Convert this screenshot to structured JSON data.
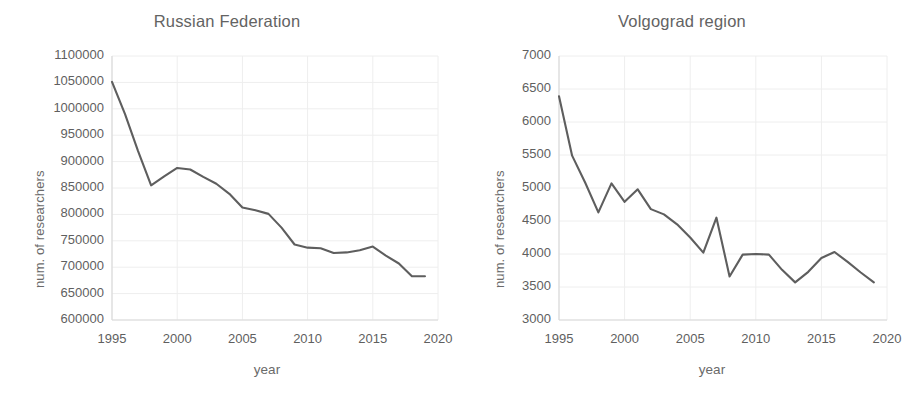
{
  "figure": {
    "background": "#ffffff",
    "line_color": "#5e5e5e",
    "grid_color": "#eeeeee",
    "axis_color": "#d9d9d9",
    "text_color": "#5f5f5f"
  },
  "chart_data": [
    {
      "type": "line",
      "title": "Russian Federation",
      "xlabel": "year",
      "ylabel": "num. of researchers",
      "xlim": [
        1995,
        2020
      ],
      "ylim": [
        600000,
        1100000
      ],
      "xticks": [
        1995,
        2000,
        2005,
        2010,
        2015,
        2020
      ],
      "yticks": [
        600000,
        650000,
        700000,
        750000,
        800000,
        850000,
        900000,
        950000,
        1000000,
        1050000,
        1100000
      ],
      "grid": true,
      "legend": "none",
      "x": [
        1995,
        1996,
        1997,
        1998,
        1999,
        2000,
        2001,
        2002,
        2003,
        2004,
        2005,
        2006,
        2007,
        2008,
        2009,
        2010,
        2011,
        2012,
        2013,
        2014,
        2015,
        2016,
        2017,
        2018,
        2019
      ],
      "values": [
        1051000,
        990000,
        920000,
        855000,
        872000,
        888000,
        885000,
        871000,
        858000,
        839000,
        813000,
        808000,
        801000,
        775000,
        743000,
        737000,
        736000,
        727000,
        728000,
        732000,
        739000,
        722000,
        707000,
        683000,
        683000
      ]
    },
    {
      "type": "line",
      "title": "Volgograd region",
      "xlabel": "year",
      "ylabel": "num. of researchers",
      "xlim": [
        1995,
        2020
      ],
      "ylim": [
        3000,
        7000
      ],
      "xticks": [
        1995,
        2000,
        2005,
        2010,
        2015,
        2020
      ],
      "yticks": [
        3000,
        3500,
        4000,
        4500,
        5000,
        5500,
        6000,
        6500,
        7000
      ],
      "grid": true,
      "legend": "none",
      "x": [
        1995,
        1996,
        1997,
        1998,
        1999,
        2000,
        2001,
        2002,
        2003,
        2004,
        2005,
        2006,
        2007,
        2008,
        2009,
        2010,
        2011,
        2012,
        2013,
        2014,
        2015,
        2016,
        2017,
        2018,
        2019
      ],
      "values": [
        6390,
        5490,
        5080,
        4630,
        5070,
        4790,
        4980,
        4680,
        4600,
        4450,
        4250,
        4020,
        4550,
        3660,
        3990,
        4000,
        3990,
        3760,
        3570,
        3730,
        3940,
        4030,
        3880,
        3720,
        3570
      ]
    }
  ]
}
